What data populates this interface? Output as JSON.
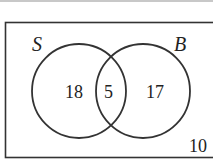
{
  "diagram": {
    "type": "venn",
    "universe_label": "",
    "sets": [
      {
        "name": "S",
        "only_count": "18"
      },
      {
        "name": "B",
        "only_count": "17"
      }
    ],
    "intersection_count": "5",
    "outside_count": "10"
  }
}
